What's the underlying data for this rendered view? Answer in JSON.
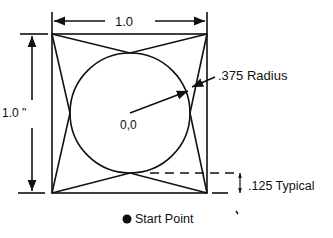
{
  "diagram": {
    "labels": {
      "width": "1.0",
      "height": "1.0 \"",
      "radius": ".375 Radius",
      "center": "0,0",
      "offset": ".125 Typical",
      "legend": "Start Point"
    },
    "colors": {
      "stroke": "#111111",
      "background": "#ffffff"
    }
  }
}
